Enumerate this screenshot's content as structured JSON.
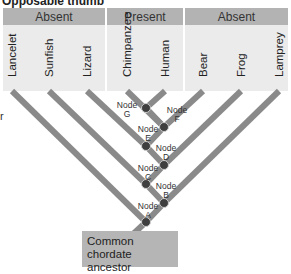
{
  "title": "Opposable thumb",
  "character_states": [
    {
      "label": "Absent",
      "x": 3,
      "width": 102
    },
    {
      "label": "Present",
      "x": 107,
      "width": 76
    },
    {
      "label": "Absent",
      "x": 185,
      "width": 103
    }
  ],
  "taxa": [
    {
      "name": "Lancelet",
      "x": 12
    },
    {
      "name": "Sunfish",
      "x": 49
    },
    {
      "name": "Lizard",
      "x": 87
    },
    {
      "name": "Chimpanzee",
      "x": 127
    },
    {
      "name": "Human",
      "x": 165
    },
    {
      "name": "Bear",
      "x": 203
    },
    {
      "name": "Frog",
      "x": 241
    },
    {
      "name": "Lamprey",
      "x": 279
    }
  ],
  "nodes": [
    {
      "id": "G",
      "label_word": "Node",
      "label_letter": "G",
      "x": 146,
      "y": 108,
      "side": "left"
    },
    {
      "id": "F",
      "label_word": "Node",
      "label_letter": "F",
      "x": 164,
      "y": 127,
      "side": "right"
    },
    {
      "id": "E",
      "label_word": "Node",
      "label_letter": "E",
      "x": 146,
      "y": 146,
      "side": "left"
    },
    {
      "id": "D",
      "label_word": "Node",
      "label_letter": "D",
      "x": 164,
      "y": 165,
      "side": "right"
    },
    {
      "id": "C",
      "label_word": "Node",
      "label_letter": "C",
      "x": 146,
      "y": 184,
      "side": "left"
    },
    {
      "id": "B",
      "label_word": "Node",
      "label_letter": "B",
      "x": 164,
      "y": 203,
      "side": "right"
    },
    {
      "id": "A",
      "label_word": "Node",
      "label_letter": "A",
      "x": 146,
      "y": 222,
      "side": "left"
    }
  ],
  "edge_fragment_left": "r",
  "root": {
    "label": "Common chordate ancestor",
    "line1": "Common chordate",
    "line2": "ancestor"
  },
  "colors": {
    "branch": "#8a8a8a",
    "node": "#3f3f3f",
    "header": "#b3b3b3",
    "taxa_bg": "#ebebeb",
    "root_box": "#b5b5b5"
  }
}
